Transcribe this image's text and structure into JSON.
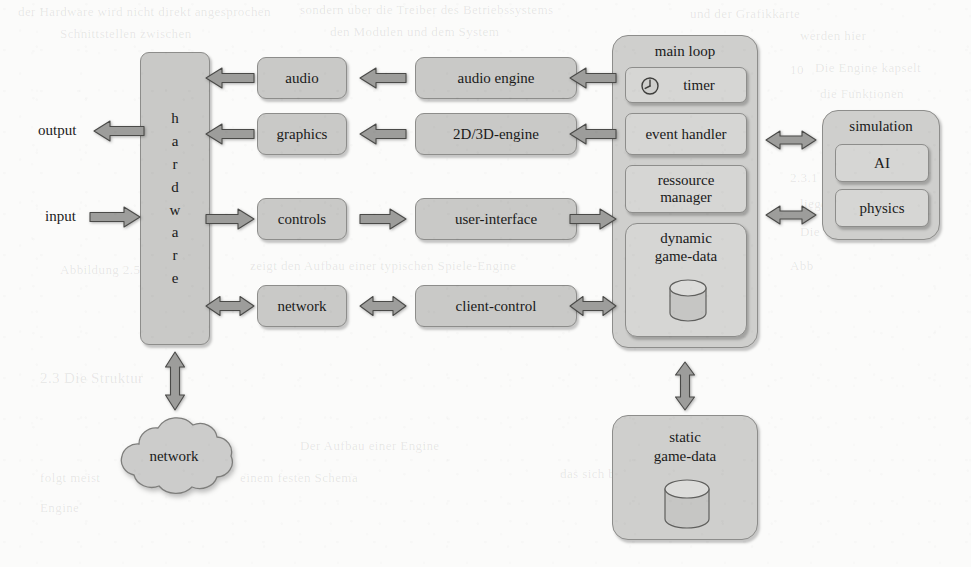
{
  "diagram": {
    "type": "block-diagram",
    "colors": {
      "page_background": "#fbfbfa",
      "node_fill": "#c9c9c7",
      "node_fill_light": "#d6d6d4",
      "node_stroke": "#8d8d8b",
      "arrow_fill": "#9d9d9b",
      "arrow_stroke": "#4a4a48",
      "text": "#1a1a1a"
    }
  },
  "io_labels": {
    "output": "output",
    "input": "input"
  },
  "hardware": {
    "label": "hardware",
    "letters": [
      "h",
      "a",
      "r",
      "d",
      "w",
      "a",
      "r",
      "e"
    ]
  },
  "driver_column": [
    {
      "label": "audio"
    },
    {
      "label": "graphics"
    },
    {
      "label": "controls"
    },
    {
      "label": "network"
    }
  ],
  "engine_column": [
    {
      "label": "audio engine"
    },
    {
      "label": "2D/3D-engine"
    },
    {
      "label": "user-interface"
    },
    {
      "label": "client-control"
    }
  ],
  "main_loop": {
    "title": "main loop",
    "items": [
      {
        "label": "timer",
        "icon": "clock-icon"
      },
      {
        "label": "event handler"
      },
      {
        "label": "ressource\nmanager",
        "line1": "ressource",
        "line2": "manager"
      },
      {
        "label": "dynamic game-data",
        "line1": "dynamic",
        "line2": "game-data",
        "icon": "database-cylinder-icon"
      }
    ]
  },
  "simulation": {
    "title": "simulation",
    "items": [
      {
        "label": "AI"
      },
      {
        "label": "physics"
      }
    ]
  },
  "static_data": {
    "line1": "static",
    "line2": "game-data",
    "icon": "database-cylinder-icon"
  },
  "network_cloud": {
    "label": "network",
    "icon": "cloud-icon"
  },
  "connections": [
    {
      "name": "output-arrow",
      "from": "hardware",
      "to": "output",
      "direction": "left"
    },
    {
      "name": "input-arrow",
      "from": "input",
      "to": "hardware",
      "direction": "right"
    },
    {
      "name": "audio-to-hardware",
      "from": "audio",
      "to": "hardware",
      "direction": "left"
    },
    {
      "name": "graphics-to-hardware",
      "from": "graphics",
      "to": "hardware",
      "direction": "left"
    },
    {
      "name": "hardware-to-controls",
      "from": "hardware",
      "to": "controls",
      "direction": "right"
    },
    {
      "name": "hardware-to-network",
      "from": "hardware",
      "to": "network",
      "direction": "both"
    },
    {
      "name": "hardware-to-network-cloud",
      "from": "hardware",
      "to": "network-cloud",
      "direction": "both"
    },
    {
      "name": "audio-engine-to-audio",
      "from": "audio engine",
      "to": "audio",
      "direction": "left"
    },
    {
      "name": "engine2d3d-to-graphics",
      "from": "2D/3D-engine",
      "to": "graphics",
      "direction": "left"
    },
    {
      "name": "controls-to-ui",
      "from": "controls",
      "to": "user-interface",
      "direction": "right"
    },
    {
      "name": "network-to-client-control",
      "from": "network",
      "to": "client-control",
      "direction": "both"
    },
    {
      "name": "mainloop-to-audio-engine",
      "from": "main loop",
      "to": "audio engine",
      "direction": "left"
    },
    {
      "name": "mainloop-to-2d3d-engine",
      "from": "main loop",
      "to": "2D/3D-engine",
      "direction": "left"
    },
    {
      "name": "ui-to-mainloop",
      "from": "user-interface",
      "to": "main loop",
      "direction": "right"
    },
    {
      "name": "client-control-to-mainloop",
      "from": "client-control",
      "to": "main loop",
      "direction": "both"
    },
    {
      "name": "mainloop-to-simulation-ai",
      "from": "main loop",
      "to": "simulation",
      "direction": "both"
    },
    {
      "name": "mainloop-to-simulation-ph",
      "from": "main loop",
      "to": "simulation",
      "direction": "both"
    },
    {
      "name": "mainloop-to-static-data",
      "from": "main loop",
      "to": "static game-data",
      "direction": "both"
    }
  ],
  "ghost_text": [
    {
      "text": "der Hardware wird nicht direkt angesprochen",
      "x": 18,
      "y": 4,
      "size": 13
    },
    {
      "text": "sondern uber die Treiber des Betriebssystems",
      "x": 300,
      "y": 2,
      "size": 13
    },
    {
      "text": "und der Grafikkarte",
      "x": 690,
      "y": 6,
      "size": 13
    },
    {
      "text": "Schnittstellen zwischen",
      "x": 60,
      "y": 26,
      "size": 13
    },
    {
      "text": "den Modulen und dem System",
      "x": 330,
      "y": 24,
      "size": 13
    },
    {
      "text": "werden hier",
      "x": 800,
      "y": 28,
      "size": 13
    },
    {
      "text": "Die Engine kapselt",
      "x": 815,
      "y": 60,
      "size": 13
    },
    {
      "text": "die Funktionen",
      "x": 820,
      "y": 86,
      "size": 13
    },
    {
      "text": "der darunter",
      "x": 822,
      "y": 112,
      "size": 13
    },
    {
      "text": "2.3.1",
      "x": 790,
      "y": 170,
      "size": 13
    },
    {
      "text": "liegenden",
      "x": 800,
      "y": 196,
      "size": 13
    },
    {
      "text": "Abbildung 2.5",
      "x": 60,
      "y": 262,
      "size": 13
    },
    {
      "text": "zeigt den Aufbau einer typischen Spiele-Engine",
      "x": 250,
      "y": 258,
      "size": 13
    },
    {
      "text": "2.3   Die Struktur",
      "x": 40,
      "y": 370,
      "size": 15
    },
    {
      "text": "Der Aufbau einer Engine",
      "x": 300,
      "y": 438,
      "size": 13
    },
    {
      "text": "folgt meist",
      "x": 40,
      "y": 470,
      "size": 13
    },
    {
      "text": "einem festen Schema",
      "x": 240,
      "y": 470,
      "size": 13
    },
    {
      "text": "das sich bewahrt hat",
      "x": 560,
      "y": 466,
      "size": 13
    },
    {
      "text": "Engine",
      "x": 40,
      "y": 500,
      "size": 13
    },
    {
      "text": "10",
      "x": 790,
      "y": 62,
      "size": 13
    },
    {
      "text": "Die",
      "x": 800,
      "y": 224,
      "size": 13
    },
    {
      "text": "Abb",
      "x": 790,
      "y": 258,
      "size": 13
    }
  ]
}
